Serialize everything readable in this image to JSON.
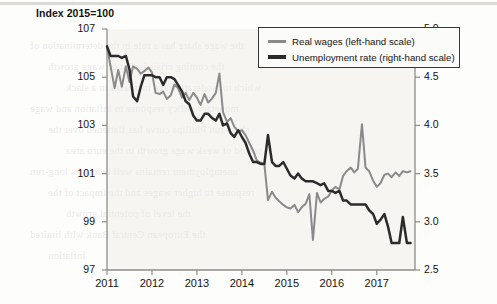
{
  "title": "Index 2015=100",
  "legend": {
    "items": [
      {
        "label": "Real wages (left-hand scale)",
        "color": "#8a8a8a",
        "icon": "line-swatch-icon"
      },
      {
        "label": "Unemployment rate (right-hand scale)",
        "color": "#2b2b2b",
        "icon": "line-swatch-icon"
      }
    ]
  },
  "bleed_text": [
    "the wage share has a role in the determination of",
    "the coming crisis is that of wage growth",
    "which to moderate wage increases in a slack",
    "monetary policy response to inflation and wage",
    "short-run Phillips curve has flattened over the",
    "a period of weak wage growth in the euro area",
    "unemployment remains well below its long-run",
    "response to higher wages and the impact of the",
    "the level of potential growth",
    "the European Central Bank with limited",
    "inflation"
  ],
  "chart_data": {
    "type": "line",
    "title": "Index 2015=100",
    "xlabel": "",
    "ylabel": "Index 2015=100",
    "y2label": "",
    "xlim": [
      2011.0,
      2017.85
    ],
    "ylim": [
      97,
      107
    ],
    "y2lim": [
      2.5,
      5.0
    ],
    "yticks": [
      97,
      99,
      101,
      103,
      105,
      107
    ],
    "y2ticks": [
      2.5,
      3.0,
      3.5,
      4.0,
      4.5,
      5.0
    ],
    "xticks": [
      2011,
      2012,
      2013,
      2014,
      2015,
      2016,
      2017
    ],
    "xticklabels": [
      "2011",
      "2012",
      "2013",
      "2014",
      "2015",
      "2016",
      "2017"
    ],
    "grid": false,
    "legend_position": "top-right",
    "series": [
      {
        "name": "Real wages (left-hand scale)",
        "axis": "left",
        "color": "#8a8a8a",
        "x": [
          2011.0,
          2011.08,
          2011.17,
          2011.25,
          2011.33,
          2011.42,
          2011.5,
          2011.58,
          2011.67,
          2011.75,
          2011.83,
          2011.92,
          2012.0,
          2012.08,
          2012.17,
          2012.25,
          2012.33,
          2012.42,
          2012.5,
          2012.58,
          2012.67,
          2012.75,
          2012.83,
          2012.92,
          2013.0,
          2013.08,
          2013.17,
          2013.25,
          2013.33,
          2013.42,
          2013.5,
          2013.58,
          2013.67,
          2013.75,
          2013.83,
          2013.92,
          2014.0,
          2014.08,
          2014.17,
          2014.25,
          2014.33,
          2014.42,
          2014.5,
          2014.58,
          2014.67,
          2014.75,
          2014.83,
          2014.92,
          2015.0,
          2015.08,
          2015.17,
          2015.25,
          2015.33,
          2015.42,
          2015.5,
          2015.58,
          2015.67,
          2015.75,
          2015.83,
          2015.92,
          2016.0,
          2016.08,
          2016.17,
          2016.25,
          2016.33,
          2016.42,
          2016.5,
          2016.58,
          2016.67,
          2016.75,
          2016.83,
          2016.92,
          2017.0,
          2017.08,
          2017.17,
          2017.25,
          2017.33,
          2017.42,
          2017.5,
          2017.58,
          2017.67,
          2017.75
        ],
        "y": [
          106.25,
          105.45,
          104.55,
          105.3,
          104.6,
          105.45,
          104.8,
          105.45,
          105.35,
          105.15,
          105.25,
          105.4,
          105.2,
          104.35,
          104.3,
          104.4,
          104.1,
          104.25,
          104.7,
          104.55,
          104.15,
          104.35,
          104.05,
          104.35,
          104.15,
          103.85,
          104.3,
          103.95,
          104.1,
          104.35,
          105.15,
          103.55,
          103.15,
          103.3,
          102.95,
          102.75,
          102.8,
          102.6,
          102.25,
          101.95,
          101.55,
          101.45,
          101.4,
          99.9,
          100.25,
          100.0,
          99.85,
          99.7,
          99.6,
          99.55,
          99.7,
          99.4,
          99.6,
          99.75,
          100.15,
          98.25,
          100.2,
          99.8,
          99.95,
          100.05,
          100.3,
          100.45,
          100.35,
          100.9,
          101.1,
          101.25,
          101.05,
          101.2,
          103.05,
          101.25,
          101.1,
          100.7,
          100.45,
          100.6,
          100.95,
          101.0,
          100.85,
          101.05,
          100.9,
          101.1,
          101.05,
          101.1
        ]
      },
      {
        "name": "Unemployment rate (right-hand scale)",
        "axis": "right",
        "color": "#2b2b2b",
        "x": [
          2011.0,
          2011.08,
          2011.17,
          2011.25,
          2011.33,
          2011.42,
          2011.5,
          2011.58,
          2011.67,
          2011.75,
          2011.83,
          2011.92,
          2012.0,
          2012.08,
          2012.17,
          2012.25,
          2012.33,
          2012.42,
          2012.5,
          2012.58,
          2012.67,
          2012.75,
          2012.83,
          2012.92,
          2013.0,
          2013.08,
          2013.17,
          2013.25,
          2013.33,
          2013.42,
          2013.5,
          2013.58,
          2013.67,
          2013.75,
          2013.83,
          2013.92,
          2014.0,
          2014.08,
          2014.17,
          2014.25,
          2014.33,
          2014.42,
          2014.5,
          2014.58,
          2014.67,
          2014.75,
          2014.83,
          2014.92,
          2015.0,
          2015.08,
          2015.17,
          2015.25,
          2015.33,
          2015.42,
          2015.5,
          2015.58,
          2015.67,
          2015.75,
          2015.83,
          2015.92,
          2016.0,
          2016.08,
          2016.17,
          2016.25,
          2016.33,
          2016.42,
          2016.5,
          2016.58,
          2016.67,
          2016.75,
          2016.83,
          2016.92,
          2017.0,
          2017.08,
          2017.17,
          2017.25,
          2017.33,
          2017.42,
          2017.5,
          2017.58,
          2017.67,
          2017.75
        ],
        "y": [
          4.82,
          4.72,
          4.72,
          4.72,
          4.7,
          4.72,
          4.58,
          4.3,
          4.25,
          4.4,
          4.52,
          4.52,
          4.52,
          4.5,
          4.5,
          4.42,
          4.5,
          4.5,
          4.48,
          4.42,
          4.35,
          4.25,
          4.22,
          4.1,
          4.05,
          4.05,
          4.12,
          4.12,
          4.08,
          4.05,
          4.12,
          4.0,
          4.02,
          3.92,
          3.88,
          3.95,
          3.88,
          3.82,
          3.7,
          3.62,
          3.62,
          3.6,
          3.6,
          3.9,
          3.62,
          3.58,
          3.58,
          3.62,
          3.55,
          3.48,
          3.45,
          3.5,
          3.45,
          3.42,
          3.42,
          3.42,
          3.4,
          3.38,
          3.4,
          3.32,
          3.32,
          3.3,
          3.32,
          3.22,
          3.22,
          3.18,
          3.18,
          3.18,
          3.18,
          3.18,
          3.12,
          3.08,
          2.98,
          3.02,
          3.08,
          2.95,
          2.78,
          2.78,
          2.78,
          3.05,
          2.78,
          2.78
        ]
      }
    ]
  }
}
